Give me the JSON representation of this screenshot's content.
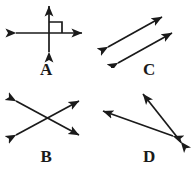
{
  "sheet": {
    "background_color": "#ffffff",
    "stroke_color": "#1a1a1a",
    "label_color": "#1a1a1a",
    "width": 195,
    "height": 172
  },
  "figures": [
    {
      "id": "a",
      "label": "A",
      "description": "perpendicular-lines-with-right-angle-mark",
      "shape": "cross",
      "right_angle_marked": true,
      "right_angle_quadrant": "upper-right",
      "arrows": [
        {
          "name": "vertical-double-arrow",
          "x1": 49,
          "y1": 52,
          "x2": 49,
          "y2": 6,
          "heads": "both"
        },
        {
          "name": "horizontal-double-arrow",
          "x1": 16,
          "y1": 33,
          "x2": 82,
          "y2": 33,
          "heads": "both"
        }
      ]
    },
    {
      "id": "c",
      "label": "C",
      "description": "two-parallel-double-arrows",
      "shape": "parallel-pair",
      "right_angle_marked": false,
      "arrows": [
        {
          "name": "upper-parallel-arrow",
          "x1": 11,
          "y1": 47,
          "x2": 65,
          "y2": 17,
          "heads": "both"
        },
        {
          "name": "lower-parallel-arrow",
          "x1": 21,
          "y1": 63,
          "x2": 75,
          "y2": 33,
          "heads": "both"
        }
      ]
    },
    {
      "id": "b",
      "label": "B",
      "description": "two-intersecting-double-arrows-forming-x",
      "shape": "x-cross",
      "right_angle_marked": false,
      "arrows": [
        {
          "name": "down-right-diagonal-arrow",
          "x1": 16,
          "y1": 15,
          "x2": 79,
          "y2": 49,
          "heads": "both"
        },
        {
          "name": "up-right-diagonal-arrow",
          "x1": 16,
          "y1": 49,
          "x2": 79,
          "y2": 15,
          "heads": "both"
        }
      ]
    },
    {
      "id": "d",
      "label": "D",
      "description": "two-double-arrows-meeting-at-acute-angle",
      "shape": "acute-angle-pair",
      "right_angle_marked": false,
      "arrows": [
        {
          "name": "steep-diagonal-arrow",
          "x1": 84,
          "y1": 56,
          "x2": 46,
          "y2": 8,
          "heads": "both"
        },
        {
          "name": "shallow-diagonal-arrow",
          "x1": 76,
          "y1": 50,
          "x2": 6,
          "y2": 25,
          "heads": "both"
        }
      ]
    }
  ]
}
